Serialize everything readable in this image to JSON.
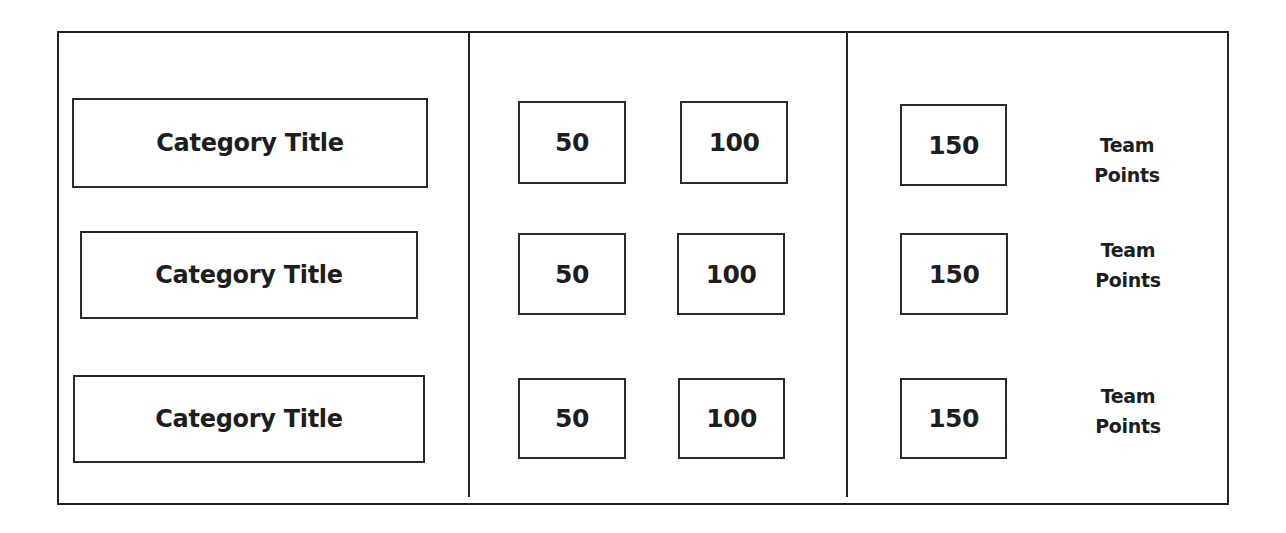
{
  "board": {
    "rows": [
      {
        "category": "Category Title",
        "points": [
          "50",
          "100",
          "150"
        ],
        "team_label": {
          "line1": "Team",
          "line2": "Points"
        }
      },
      {
        "category": "Category Title",
        "points": [
          "50",
          "100",
          "150"
        ],
        "team_label": {
          "line1": "Team",
          "line2": "Points"
        }
      },
      {
        "category": "Category Title",
        "points": [
          "50",
          "100",
          "150"
        ],
        "team_label": {
          "line1": "Team",
          "line2": "Points"
        }
      }
    ]
  },
  "colors": {
    "line": "#222222",
    "text": "#1e1e1e",
    "background": "#ffffff"
  }
}
